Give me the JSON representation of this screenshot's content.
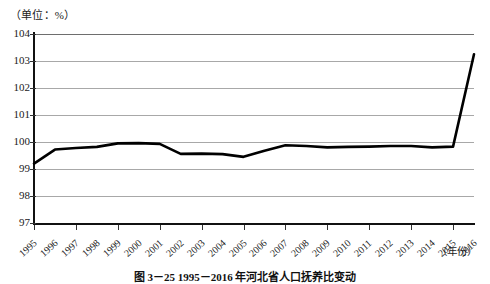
{
  "chart_data": {
    "type": "line",
    "title": "",
    "unit_label": "（单位：%）",
    "xlabel": "（年份）",
    "ylabel": "",
    "ylim": [
      97,
      104
    ],
    "yticks": [
      97,
      98,
      99,
      100,
      101,
      102,
      103,
      104
    ],
    "grid": true,
    "legend": null,
    "categories": [
      "1995",
      "1996",
      "1997",
      "1998",
      "1999",
      "2000",
      "2001",
      "2002",
      "2003",
      "2004",
      "2005",
      "2006",
      "2007",
      "2008",
      "2009",
      "2010",
      "2011",
      "2012",
      "2013",
      "2014",
      "2015",
      "2016"
    ],
    "values": [
      99.2,
      99.72,
      99.78,
      99.82,
      99.95,
      99.96,
      99.93,
      99.56,
      99.57,
      99.55,
      99.45,
      99.68,
      99.88,
      99.85,
      99.8,
      99.82,
      99.83,
      99.85,
      99.85,
      99.8,
      99.83,
      103.25
    ],
    "series_color": "#000000",
    "grid_color": "#a8a8a8",
    "axis_color": "#111111"
  },
  "caption": {
    "text": "图 3－25  1995－2016 年河北省人口抚养比变动"
  }
}
